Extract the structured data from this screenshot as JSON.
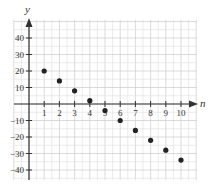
{
  "chart_data": {
    "type": "scatter",
    "title": "",
    "xlabel": "n",
    "ylabel": "y",
    "x": [
      1,
      2,
      3,
      4,
      5,
      6,
      7,
      8,
      9,
      10
    ],
    "series": [
      {
        "name": "a_n",
        "values": [
          20,
          14,
          8,
          2,
          -4,
          -10,
          -16,
          -22,
          -28,
          -34
        ]
      }
    ],
    "x_ticks": [
      1,
      2,
      3,
      4,
      5,
      6,
      7,
      8,
      9,
      10
    ],
    "y_ticks": [
      40,
      30,
      20,
      10,
      -10,
      -20,
      -30,
      -40
    ],
    "xlim": [
      -1,
      11
    ],
    "ylim": [
      -50,
      50
    ],
    "grid": true,
    "legend": "none",
    "colors": {
      "point": "#222222",
      "axis": "#333333",
      "grid_minor": "#e3e3e3",
      "grid_major": "#cccccc"
    }
  }
}
